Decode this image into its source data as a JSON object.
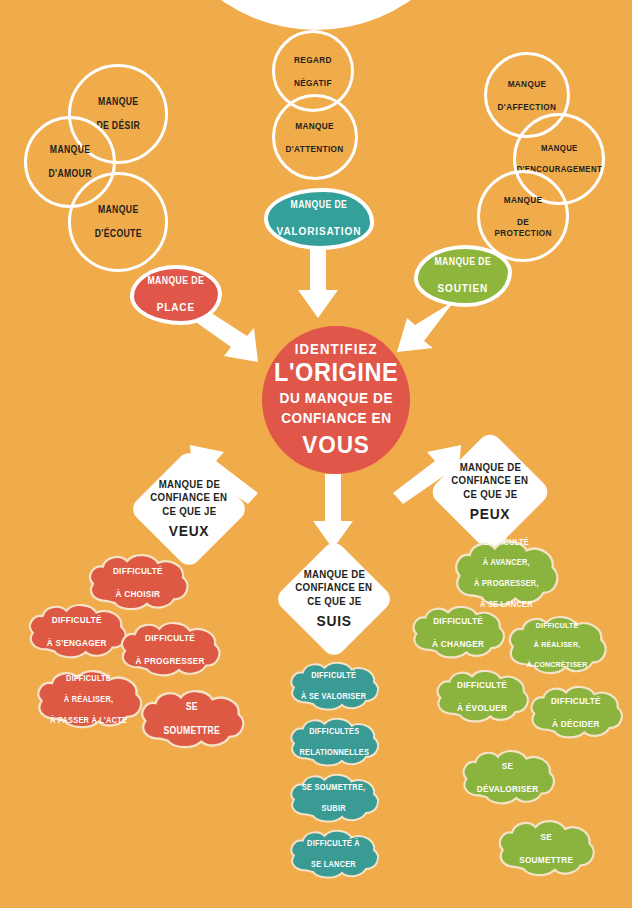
{
  "poster": {
    "background_color": "#F0AB4A",
    "red": "#E0574A",
    "teal": "#33A09A",
    "green": "#8EB63C",
    "white": "#FFFFFF"
  },
  "center": {
    "line1": "IDENTIFIEZ",
    "line2": "L'ORIGINE",
    "line3a": "DU MANQUE DE",
    "line3b": "CONFIANCE EN",
    "line4": "VOUS"
  },
  "outline_circles": [
    {
      "id": "manque-de-desir",
      "lines": [
        "MANQUE",
        "DE DÉSIR"
      ]
    },
    {
      "id": "manque-damour",
      "lines": [
        "MANQUE",
        "D'AMOUR"
      ]
    },
    {
      "id": "manque-decoute",
      "lines": [
        "MANQUE",
        "D'ÉCOUTE"
      ]
    },
    {
      "id": "regard-negatif",
      "lines": [
        "REGARD",
        "NÉGATIF"
      ]
    },
    {
      "id": "manque-dattention",
      "lines": [
        "MANQUE",
        "D'ATTENTION"
      ]
    },
    {
      "id": "manque-daffection",
      "lines": [
        "MANQUE",
        "D'AFFECTION"
      ]
    },
    {
      "id": "manque-dencouragement",
      "lines": [
        "MANQUE",
        "D'ENCOURAGEMENT"
      ]
    },
    {
      "id": "manque-de-protection",
      "lines": [
        "MANQUE",
        "DE PROTECTION"
      ]
    }
  ],
  "blobs": [
    {
      "id": "manque-de-valorisation",
      "small": "MANQUE DE",
      "big": "VALORISATION",
      "color": "teal"
    },
    {
      "id": "manque-de-soutien",
      "small": "MANQUE DE",
      "big": "SOUTIEN",
      "color": "green"
    },
    {
      "id": "manque-de-place",
      "small": "MANQUE DE",
      "big": "PLACE",
      "color": "red"
    }
  ],
  "diamonds": [
    {
      "id": "confiance-veux",
      "line1": "MANQUE DE",
      "line2": "CONFIANCE EN",
      "line3": "CE QUE JE",
      "keyword": "VEUX"
    },
    {
      "id": "confiance-suis",
      "line1": "MANQUE DE",
      "line2": "CONFIANCE EN",
      "line3": "CE QUE JE",
      "keyword": "SUIS"
    },
    {
      "id": "confiance-peux",
      "line1": "MANQUE DE",
      "line2": "CONFIANCE EN",
      "line3": "CE QUE JE",
      "keyword": "PEUX"
    }
  ],
  "clouds_veux": [
    {
      "id": "difficulte-a-choisir",
      "lines": [
        "DIFFICULTÉ",
        "À CHOISIR"
      ]
    },
    {
      "id": "difficulte-a-sengager",
      "lines": [
        "DIFFICULTÉ",
        "À S'ENGAGER"
      ]
    },
    {
      "id": "difficulte-a-progresser",
      "lines": [
        "DIFFICULTÉ",
        "À PROGRESSER"
      ]
    },
    {
      "id": "difficulte-a-realiser",
      "lines": [
        "DIFFICULTÉ",
        "À RÉALISER,",
        "À PASSER À L'ACTE"
      ]
    },
    {
      "id": "se-soumettre-rouge",
      "lines": [
        "SE",
        "SOUMETTRE"
      ]
    }
  ],
  "clouds_suis": [
    {
      "id": "difficulte-a-se-valoriser",
      "lines": [
        "DIFFICULTÉ",
        "À SE VALORISER"
      ]
    },
    {
      "id": "difficultes-relationnelles",
      "lines": [
        "DIFFICULTÉS",
        "RELATIONNELLES"
      ]
    },
    {
      "id": "se-soumettre-subir",
      "lines": [
        "SE SOUMETTRE,",
        "SUBIR"
      ]
    },
    {
      "id": "difficulte-a-se-lancer",
      "lines": [
        "DIFFICULTÉ À",
        "SE LANCER"
      ]
    }
  ],
  "clouds_peux": [
    {
      "id": "difficulte-a-avancer",
      "lines": [
        "DIFFICULTÉ",
        "À AVANCER,",
        "À PROGRESSER,",
        "À SE LANCER"
      ]
    },
    {
      "id": "difficulte-a-changer",
      "lines": [
        "DIFFICULTÉ",
        "À CHANGER"
      ]
    },
    {
      "id": "difficulte-a-realiser-v",
      "lines": [
        "DIFFICULTÉ",
        "À RÉALISER,",
        "À CONCRÉTISER"
      ]
    },
    {
      "id": "difficulte-a-evoluer",
      "lines": [
        "DIFFICULTÉ",
        "À ÉVOLUER"
      ]
    },
    {
      "id": "difficulte-a-decider",
      "lines": [
        "DIFFICULTÉ",
        "À DÉCIDER"
      ]
    },
    {
      "id": "se-devaloriser",
      "lines": [
        "SE",
        "DÉVALORISER"
      ]
    },
    {
      "id": "se-soumettre-vert",
      "lines": [
        "SE",
        "SOUMETTRE"
      ]
    }
  ]
}
